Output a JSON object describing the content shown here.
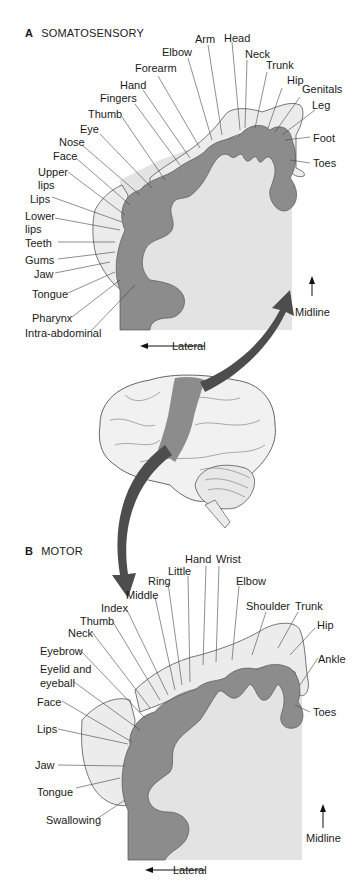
{
  "panel_a": {
    "letter": "A",
    "title": "SOMATOSENSORY",
    "labels": [
      "Arm",
      "Head",
      "Elbow",
      "Neck",
      "Trunk",
      "Forearm",
      "Hip",
      "Genitals",
      "Hand",
      "Leg",
      "Fingers",
      "Thumb",
      "Foot",
      "Eye",
      "Nose",
      "Toes",
      "Face",
      "Upper",
      "lips",
      "Lips",
      "Lower",
      "lips",
      "Teeth",
      "Gums",
      "Jaw",
      "Tongue",
      "Pharynx",
      "Intra-abdominal"
    ],
    "lateral": "Lateral",
    "midline": "Midline"
  },
  "panel_b": {
    "letter": "B",
    "title": "MOTOR",
    "labels": [
      "Hand",
      "Wrist",
      "Little",
      "Ring",
      "Elbow",
      "Middle",
      "Index",
      "Shoulder",
      "Trunk",
      "Thumb",
      "Hip",
      "Neck",
      "Eyebrow",
      "Ankle",
      "Eyelid and",
      "eyeball",
      "Face",
      "Toes",
      "Lips",
      "Jaw",
      "Tongue",
      "Swallowing"
    ],
    "lateral": "Lateral",
    "midline": "Midline"
  },
  "colors": {
    "cortex": "#8c8c8c",
    "white_matter": "#e3e3e3",
    "homunculus": "#ececec",
    "brain": "#f1f1f1",
    "arrow": "#4d4d4d"
  }
}
